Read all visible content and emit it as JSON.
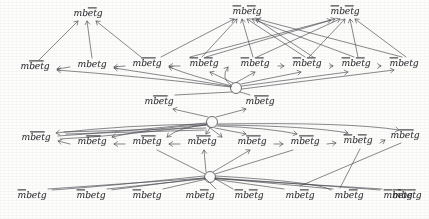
{
  "diagram": {
    "background_color": "#fdfdfb",
    "ink_color": "#4a4a52",
    "base_word": "mbetg",
    "hub_count": 2,
    "row_count": 5,
    "nodes": [
      {
        "id": "n1",
        "label": "mbetg",
        "bars": "et",
        "x": 88,
        "y": 14,
        "row": 1
      },
      {
        "id": "n2",
        "label": "mbetg",
        "bars": "m,et",
        "x": 247,
        "y": 12,
        "row": 1
      },
      {
        "id": "n3",
        "label": "mbetg",
        "bars": "m,et",
        "x": 345,
        "y": 12,
        "row": 1
      },
      {
        "id": "n4",
        "label": "mbetg",
        "bars": "bet",
        "x": 35,
        "y": 67,
        "row": 2
      },
      {
        "id": "n5",
        "label": "mbetg",
        "bars": "",
        "x": 92,
        "y": 65,
        "row": 2
      },
      {
        "id": "n6",
        "label": "mbetg",
        "bars": "bet",
        "x": 147,
        "y": 64,
        "row": 2
      },
      {
        "id": "n7",
        "label": "mbetg",
        "bars": "m,et",
        "x": 204,
        "y": 64,
        "row": 2
      },
      {
        "id": "n8",
        "label": "mbetg",
        "bars": "m,et",
        "x": 255,
        "y": 64,
        "row": 2
      },
      {
        "id": "n9",
        "label": "mbetg",
        "bars": "m,et",
        "x": 307,
        "y": 64,
        "row": 2
      },
      {
        "id": "n10",
        "label": "mbetg",
        "bars": "m,et",
        "x": 356,
        "y": 64,
        "row": 2
      },
      {
        "id": "n11",
        "label": "mbetg",
        "bars": "m",
        "x": 404,
        "y": 64,
        "row": 2
      },
      {
        "id": "n12",
        "label": "mbetg",
        "bars": "bet",
        "x": 159,
        "y": 102,
        "row": 3
      },
      {
        "id": "n13",
        "label": "mbetg",
        "bars": "bet",
        "x": 260,
        "y": 102,
        "row": 3
      },
      {
        "id": "n14",
        "label": "mbetg",
        "bars": "bet",
        "x": 36,
        "y": 138,
        "row": 4
      },
      {
        "id": "n15",
        "label": "mbetg",
        "bars": "bet",
        "x": 92,
        "y": 142,
        "row": 4
      },
      {
        "id": "n16",
        "label": "mbetg",
        "bars": "bet",
        "x": 147,
        "y": 142,
        "row": 4
      },
      {
        "id": "n17",
        "label": "mbetg",
        "bars": "bet",
        "x": 202,
        "y": 142,
        "row": 4
      },
      {
        "id": "n18",
        "label": "mbetg",
        "bars": "bet",
        "x": 252,
        "y": 142,
        "row": 4
      },
      {
        "id": "n19",
        "label": "mbetg",
        "bars": "bet",
        "x": 305,
        "y": 142,
        "row": 4
      },
      {
        "id": "n20",
        "label": "mbetg",
        "bars": "m,et",
        "x": 358,
        "y": 141,
        "row": 4
      },
      {
        "id": "n21",
        "label": "mbetg",
        "bars": "bet",
        "x": 405,
        "y": 136,
        "row": 4
      },
      {
        "id": "n22",
        "label": "mbetg",
        "bars": "m",
        "x": 32,
        "y": 196,
        "row": 5
      },
      {
        "id": "n23",
        "label": "mbetg",
        "bars": "m",
        "x": 91,
        "y": 196,
        "row": 5
      },
      {
        "id": "n24",
        "label": "mbetg",
        "bars": "m",
        "x": 147,
        "y": 196,
        "row": 5
      },
      {
        "id": "n25",
        "label": "mbetg",
        "bars": "et",
        "x": 200,
        "y": 196,
        "row": 5
      },
      {
        "id": "n26",
        "label": "mbetg",
        "bars": "m,et",
        "x": 249,
        "y": 196,
        "row": 5
      },
      {
        "id": "n27",
        "label": "mbetg",
        "bars": "et",
        "x": 300,
        "y": 196,
        "row": 5
      },
      {
        "id": "n28",
        "label": "mbetg",
        "bars": "et",
        "x": 349,
        "y": 196,
        "row": 5
      },
      {
        "id": "n29",
        "label": "mbetg",
        "bars": "m,et",
        "x": 398,
        "y": 196,
        "row": 5
      },
      {
        "id": "n30",
        "label": "mbetg",
        "bars": "m,et",
        "x": 407,
        "y": 196,
        "row": 5
      }
    ],
    "hubs": [
      {
        "id": "h1",
        "x": 236,
        "y": 88,
        "r": 5.5
      },
      {
        "id": "h2",
        "x": 212,
        "y": 122,
        "r": 5.5
      },
      {
        "id": "h3",
        "x": 210,
        "y": 177,
        "r": 5.5
      }
    ],
    "edge_count": 64,
    "arrow_style": "thin-open-head"
  }
}
